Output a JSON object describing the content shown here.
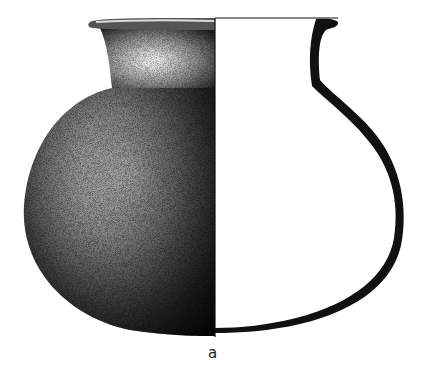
{
  "figure": {
    "type": "archaeological-pottery-drawing",
    "left_half": "exterior view, stippled shading",
    "right_half": "profile section, solid black wall",
    "caption": "a",
    "colors": {
      "ink": "#111111",
      "paper": "#ffffff"
    }
  }
}
